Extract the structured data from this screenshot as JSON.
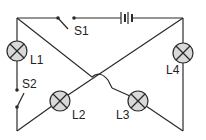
{
  "diagram": {
    "type": "circuit",
    "components": {
      "switches": [
        {
          "label": "S1"
        },
        {
          "label": "S2"
        }
      ],
      "lamps": [
        {
          "label": "L1"
        },
        {
          "label": "L2"
        },
        {
          "label": "L3"
        },
        {
          "label": "L4"
        }
      ],
      "battery": {
        "label": ""
      }
    },
    "colors": {
      "wire": "#2a2a2a",
      "lamp_fill": "#d9d9d9"
    }
  }
}
